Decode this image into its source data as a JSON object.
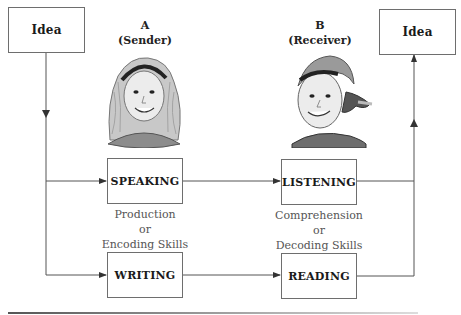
{
  "diagram": {
    "left_idea": {
      "label": "Idea"
    },
    "right_idea": {
      "label": "Idea"
    },
    "sender": {
      "letter": "A",
      "role": "(Sender)",
      "icon": "girl-face-icon"
    },
    "receiver": {
      "letter": "B",
      "role": "(Receiver)",
      "icon": "boy-face-icon"
    },
    "boxes": {
      "speaking": "SPEAKING",
      "writing": "WRITING",
      "listening": "LISTENING",
      "reading": "READING"
    },
    "sender_skills": {
      "line1": "Production",
      "line2": "or",
      "line3": "Encoding Skills"
    },
    "receiver_skills": {
      "line1": "Comprehension",
      "line2": "or",
      "line3": "Decoding Skills"
    },
    "colors": {
      "line": "#555555",
      "box_border": "#6e6e6e",
      "text": "#1a1a1a",
      "skills_text": "#555555"
    }
  }
}
